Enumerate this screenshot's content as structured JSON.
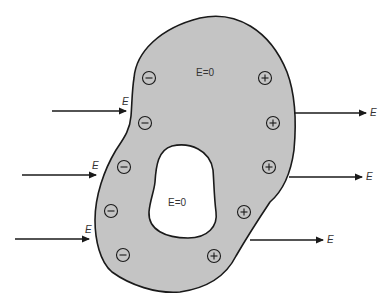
{
  "figure": {
    "colors": {
      "conductor_fill": "#c4c4c4",
      "outline": "#1a1a1a",
      "background": "#ffffff",
      "cavity_fill": "#ffffff"
    },
    "labels": {
      "field_symbol": "E",
      "inside_conductor": "E=0",
      "inside_cavity": "E=0"
    },
    "incoming_arrows": [
      {
        "x1": 52,
        "x2": 126,
        "y": 111,
        "label": "E"
      },
      {
        "x1": 22,
        "x2": 96,
        "y": 175,
        "label": "E"
      },
      {
        "x1": 15,
        "x2": 89,
        "y": 239,
        "label": "E"
      }
    ],
    "outgoing_arrows": [
      {
        "x1": 294,
        "x2": 366,
        "y": 113,
        "label": "E"
      },
      {
        "x1": 289,
        "x2": 362,
        "y": 177,
        "label": "E"
      },
      {
        "x1": 250,
        "x2": 323,
        "y": 240,
        "label": "E"
      }
    ],
    "negative_charges": [
      {
        "x": 149,
        "y": 78
      },
      {
        "x": 145,
        "y": 123
      },
      {
        "x": 124,
        "y": 167
      },
      {
        "x": 111,
        "y": 211
      },
      {
        "x": 123,
        "y": 255
      }
    ],
    "positive_charges": [
      {
        "x": 265,
        "y": 78
      },
      {
        "x": 273,
        "y": 123
      },
      {
        "x": 269,
        "y": 167
      },
      {
        "x": 244,
        "y": 212
      },
      {
        "x": 214,
        "y": 256
      }
    ],
    "charge_symbols": {
      "negative": "−",
      "positive": "+"
    }
  }
}
